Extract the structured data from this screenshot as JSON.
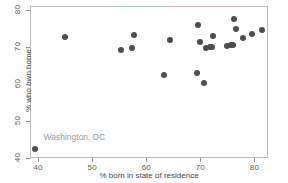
{
  "chart_data": {
    "type": "scatter",
    "title": "",
    "xlabel": "% born in state of residence",
    "ylabel": "% who own home",
    "xlim": [
      38.5,
      82.5
    ],
    "ylim": [
      40,
      81
    ],
    "xticks": [
      40,
      50,
      60,
      70,
      80
    ],
    "yticks": [
      40,
      50,
      60,
      70,
      80
    ],
    "xtick_labels": [
      "40",
      "50",
      "60",
      "70",
      "80"
    ],
    "ytick_labels": [
      "40",
      "50",
      "60",
      "70",
      "80"
    ],
    "grid": false,
    "legend": "none",
    "marker": {
      "shape": "circle",
      "color": "#4d4d4d",
      "size": 6
    },
    "points": [
      {
        "x": 39.5,
        "y": 42.5,
        "label": "Washington, DC"
      },
      {
        "x": 45.0,
        "y": 72.7,
        "label": ""
      },
      {
        "x": 55.4,
        "y": 69.1,
        "label": ""
      },
      {
        "x": 57.4,
        "y": 69.7,
        "label": ""
      },
      {
        "x": 57.7,
        "y": 73.3,
        "label": ""
      },
      {
        "x": 63.3,
        "y": 62.3,
        "label": ""
      },
      {
        "x": 64.3,
        "y": 71.8,
        "label": ""
      },
      {
        "x": 69.3,
        "y": 63.0,
        "label": ""
      },
      {
        "x": 69.5,
        "y": 76.0,
        "label": ""
      },
      {
        "x": 70.0,
        "y": 71.3,
        "label": ""
      },
      {
        "x": 70.6,
        "y": 60.3,
        "label": ""
      },
      {
        "x": 71.0,
        "y": 69.6,
        "label": ""
      },
      {
        "x": 71.8,
        "y": 69.9,
        "label": ""
      },
      {
        "x": 72.2,
        "y": 69.9,
        "label": ""
      },
      {
        "x": 72.3,
        "y": 72.8,
        "label": ""
      },
      {
        "x": 74.9,
        "y": 70.1,
        "label": ""
      },
      {
        "x": 75.7,
        "y": 70.5,
        "label": ""
      },
      {
        "x": 76.1,
        "y": 70.6,
        "label": ""
      },
      {
        "x": 76.3,
        "y": 77.4,
        "label": ""
      },
      {
        "x": 76.6,
        "y": 74.7,
        "label": ""
      },
      {
        "x": 77.9,
        "y": 72.4,
        "label": ""
      },
      {
        "x": 79.5,
        "y": 73.4,
        "label": ""
      },
      {
        "x": 81.4,
        "y": 74.6,
        "label": ""
      }
    ],
    "annotations": [
      {
        "text": "Washington, DC",
        "x": 41.0,
        "y": 45.3,
        "color": "#9a9a9a"
      }
    ]
  },
  "colors": {
    "marker": "#4d4d4d",
    "frame": "#b9b9b9",
    "tick": "#8e8e8e",
    "tick_label": "#5a5a5a",
    "axis_title": "#454545",
    "annotation": "#9a9a9a",
    "background": "#ffffff"
  }
}
